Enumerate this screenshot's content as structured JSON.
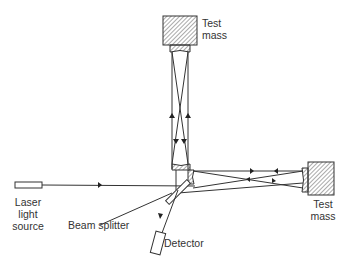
{
  "diagram": {
    "type": "interferometer",
    "labels": {
      "top_test_mass": [
        "Test",
        "mass"
      ],
      "right_test_mass": [
        "Test",
        "mass"
      ],
      "laser": [
        "Laser",
        "light",
        "source"
      ],
      "beam_splitter": "Beam splitter",
      "detector": "Detector"
    },
    "colors": {
      "line": "#333333",
      "hatch": "#555555",
      "background": "#ffffff"
    }
  }
}
